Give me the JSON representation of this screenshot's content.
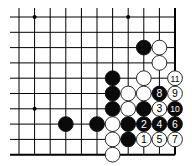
{
  "diagram": {
    "type": "go-board-fragment",
    "grid": {
      "cols_x": [
        19,
        34.6,
        50.2,
        65.8,
        81.4,
        97,
        112.6,
        128.2,
        143.8,
        159.4,
        175
      ],
      "rows_y": [
        17,
        32.3,
        47.6,
        62.9,
        78.2,
        93.5,
        108.8,
        124.1,
        139.4,
        154.7
      ],
      "left_x": 10,
      "right_edge_col": 10,
      "bottom_edge_row": 9,
      "line_color": "#000000",
      "edge_width": 2
    },
    "star_points": [
      {
        "col": 1,
        "row": 0
      },
      {
        "col": 7,
        "row": 0
      },
      {
        "col": 1,
        "row": 6
      }
    ],
    "stones": [
      {
        "color": "black",
        "col": 8,
        "row": 2,
        "label": ""
      },
      {
        "color": "white",
        "col": 9,
        "row": 2,
        "label": ""
      },
      {
        "color": "white",
        "col": 9,
        "row": 3,
        "label": ""
      },
      {
        "color": "black",
        "col": 6,
        "row": 4,
        "label": ""
      },
      {
        "color": "white",
        "col": 8,
        "row": 4,
        "label": ""
      },
      {
        "color": "white",
        "col": 10,
        "row": 4,
        "label": "11"
      },
      {
        "color": "black",
        "col": 6,
        "row": 5,
        "label": ""
      },
      {
        "color": "white",
        "col": 7,
        "row": 5,
        "label": ""
      },
      {
        "color": "white",
        "col": 8,
        "row": 5,
        "label": ""
      },
      {
        "color": "black",
        "col": 9,
        "row": 5,
        "label": "8"
      },
      {
        "color": "white",
        "col": 10,
        "row": 5,
        "label": "9"
      },
      {
        "color": "black",
        "col": 6,
        "row": 6,
        "label": ""
      },
      {
        "color": "white",
        "col": 7,
        "row": 6,
        "label": ""
      },
      {
        "color": "black",
        "col": 8,
        "row": 6,
        "label": ""
      },
      {
        "color": "white",
        "col": 9,
        "row": 6,
        "label": "3"
      },
      {
        "color": "black",
        "col": 10,
        "row": 6,
        "label": "10"
      },
      {
        "color": "black",
        "col": 3,
        "row": 7,
        "label": ""
      },
      {
        "color": "black",
        "col": 5,
        "row": 7,
        "label": ""
      },
      {
        "color": "white",
        "col": 6,
        "row": 7,
        "label": ""
      },
      {
        "color": "black",
        "col": 7,
        "row": 7,
        "label": ""
      },
      {
        "color": "black",
        "col": 8,
        "row": 7,
        "label": "2"
      },
      {
        "color": "black",
        "col": 9,
        "row": 7,
        "label": "4"
      },
      {
        "color": "black",
        "col": 10,
        "row": 7,
        "label": "6"
      },
      {
        "color": "white",
        "col": 6,
        "row": 8,
        "label": ""
      },
      {
        "color": "black",
        "col": 7,
        "row": 8,
        "label": ""
      },
      {
        "color": "white",
        "col": 8,
        "row": 8,
        "label": "1"
      },
      {
        "color": "white",
        "col": 9,
        "row": 8,
        "label": "5"
      },
      {
        "color": "white",
        "col": 10,
        "row": 8,
        "label": "7"
      },
      {
        "color": "white",
        "col": 6,
        "row": 9,
        "label": ""
      }
    ],
    "colors": {
      "black_stone": "#0a0a0a",
      "white_stone": "#ffffff",
      "stone_outline": "#111111",
      "board": "#ffffff"
    }
  }
}
